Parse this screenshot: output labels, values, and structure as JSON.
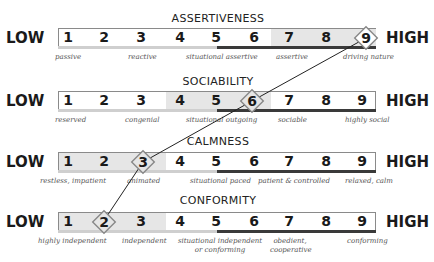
{
  "labels": {
    "low": "LOW",
    "high": "HIGH"
  },
  "numbers": [
    "1",
    "2",
    "3",
    "4",
    "5",
    "6",
    "7",
    "8",
    "9"
  ],
  "colors": {
    "shade": "#e6e6e6",
    "stripe_dark": "#3a3a3a",
    "stripe_light": "#cfcfcf",
    "border": "#8a8a8a"
  },
  "scales": [
    {
      "title": "ASSERTIVENESS",
      "value": 9,
      "shaded_range": [
        7,
        9
      ],
      "descriptors": [
        {
          "text": "passive",
          "at": 1
        },
        {
          "text": "reactive",
          "at": 3
        },
        {
          "text": "situational assertive",
          "at": 5
        },
        {
          "text": "assertive",
          "at": 7
        },
        {
          "text": "driving nature",
          "at": 9
        }
      ]
    },
    {
      "title": "SOCIABILITY",
      "value": 6,
      "shaded_range": [
        4,
        6
      ],
      "descriptors": [
        {
          "text": "reserved",
          "at": 1
        },
        {
          "text": "congenial",
          "at": 3
        },
        {
          "text": "situational outgoing",
          "at": 5
        },
        {
          "text": "sociable",
          "at": 7
        },
        {
          "text": "highly social",
          "at": 9
        }
      ]
    },
    {
      "title": "CALMNESS",
      "value": 3,
      "shaded_range": [
        1,
        3
      ],
      "descriptors": [
        {
          "text": "restless, impatient",
          "at": 1.5
        },
        {
          "text": "animated",
          "at": 3
        },
        {
          "text": "situational paced",
          "at": 5
        },
        {
          "text": "patient & controlled",
          "at": 6.5
        },
        {
          "text": "relaxed, calm",
          "at": 9
        }
      ]
    },
    {
      "title": "CONFORMITY",
      "value": 2,
      "shaded_range": [
        1,
        3
      ],
      "descriptors": [
        {
          "text": "highly independent",
          "at": 1.5
        },
        {
          "text": "independent",
          "at": 3
        },
        {
          "text": "situational independent or conforming",
          "at": 5
        },
        {
          "text": "obedient, cooperative",
          "at": 7
        },
        {
          "text": "conforming",
          "at": 9
        }
      ]
    }
  ]
}
